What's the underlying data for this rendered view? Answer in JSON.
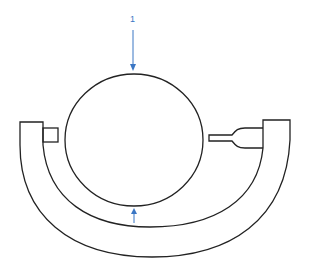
{
  "diagram": {
    "labels": [
      {
        "id": "label-1",
        "text": "1",
        "x": 131,
        "y": 10
      }
    ],
    "colors": {
      "stroke": "#222222",
      "arrow": "#3a76c4",
      "background": "#ffffff"
    },
    "parts": {
      "sphere": {
        "cx": 134,
        "cy": 140,
        "rx": 69,
        "ry": 66
      },
      "frame": "u-shaped-c-frame",
      "anvil": "left-anvil",
      "spindle": "right-spindle",
      "arrows": [
        "top-arrow-down",
        "bottom-arrow-up"
      ]
    }
  }
}
